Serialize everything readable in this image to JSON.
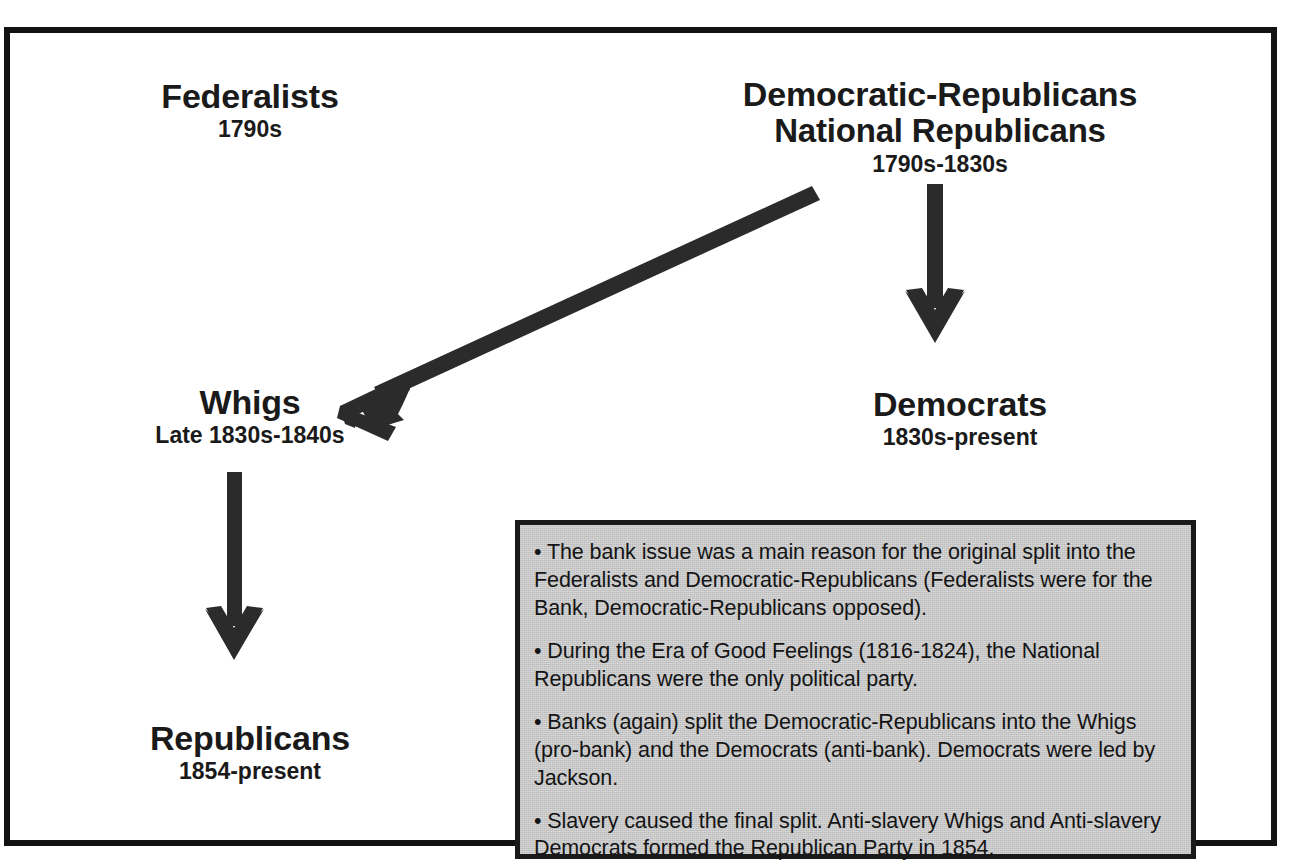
{
  "diagram": {
    "frame_color": "#121212",
    "background_color": "#ffffff",
    "arrow_color": "#2b2b2b",
    "notes_fill_color": "#c6c6c6"
  },
  "nodes": [
    {
      "id": "federalists",
      "name": "Federalists",
      "years": "1790s"
    },
    {
      "id": "democratic-republicans",
      "name_line1": "Democratic-Republicans",
      "name_line2": "National Republicans",
      "years": "1790s-1830s"
    },
    {
      "id": "whigs",
      "name": "Whigs",
      "years": "Late 1830s-1840s"
    },
    {
      "id": "democrats",
      "name": "Democrats",
      "years": "1830s-present"
    },
    {
      "id": "republicans",
      "name": "Republicans",
      "years": "1854-present"
    }
  ],
  "arrows": [
    {
      "id": "demrep-to-whigs",
      "from": "democratic-republicans",
      "to": "whigs",
      "direction": "diagonal-down-left"
    },
    {
      "id": "demrep-to-democrats",
      "from": "democratic-republicans",
      "to": "democrats",
      "direction": "down"
    },
    {
      "id": "whigs-to-republicans",
      "from": "whigs",
      "to": "republicans",
      "direction": "down"
    }
  ],
  "notes": {
    "items": [
      "• The bank issue was a main reason for the original split into the Federalists and Democratic-Republicans (Federalists were for the Bank, Democratic-Republicans opposed).",
      "• During the Era of Good Feelings (1816-1824), the National Republicans were the only political party.",
      "• Banks (again) split the Democratic-Republicans into the Whigs (pro-bank) and the Democrats (anti-bank). Democrats were led by Jackson.",
      "• Slavery caused the final split. Anti-slavery Whigs and Anti-slavery Democrats formed the Republican Party in 1854."
    ]
  }
}
